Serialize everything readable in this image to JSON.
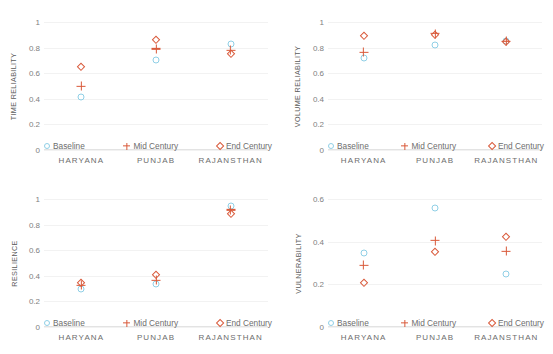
{
  "figure": {
    "categories": [
      "HARYANA",
      "PUNJAB",
      "RAJANSTHAN"
    ],
    "legend": [
      {
        "label": "Baseline",
        "marker": "circle-marker-icon",
        "color": "#8fcfe6"
      },
      {
        "label": "Mid Century",
        "marker": "plus-marker-icon",
        "color": "#d9593a"
      },
      {
        "label": "End Century",
        "marker": "diamond-marker-icon",
        "color": "#d9593a"
      }
    ]
  },
  "chart_data": [
    {
      "type": "scatter",
      "title": "",
      "ylabel": "TIME RELIABILITY",
      "xlabel": "",
      "categories": [
        "HARYANA",
        "PUNJAB",
        "RAJANSTHAN"
      ],
      "ylim": [
        0,
        1
      ],
      "yticks": [
        "0",
        "0.2",
        "0.4",
        "0.6",
        "0.8",
        "1"
      ],
      "ytick_values": [
        0,
        0.2,
        0.4,
        0.6,
        0.8,
        1
      ],
      "grid": true,
      "legend_position": "lower-center",
      "series": [
        {
          "name": "Baseline",
          "values": [
            0.415,
            0.7,
            0.83
          ]
        },
        {
          "name": "Mid Century",
          "values": [
            0.5,
            0.79,
            0.78
          ]
        },
        {
          "name": "End Century",
          "values": [
            0.65,
            0.86,
            0.75
          ]
        }
      ]
    },
    {
      "type": "scatter",
      "title": "",
      "ylabel": "VOLUME RELIABILITY",
      "xlabel": "",
      "categories": [
        "HARYANA",
        "PUNJAB",
        "RAJANSTHAN"
      ],
      "ylim": [
        0,
        1
      ],
      "yticks": [
        "0",
        "0.2",
        "0.4",
        "0.6",
        "0.8",
        "1"
      ],
      "ytick_values": [
        0,
        0.2,
        0.4,
        0.6,
        0.8,
        1
      ],
      "grid": true,
      "legend_position": "lower-center",
      "series": [
        {
          "name": "Baseline",
          "values": [
            0.72,
            0.82,
            0.85
          ]
        },
        {
          "name": "Mid Century",
          "values": [
            0.765,
            0.91,
            0.85
          ]
        },
        {
          "name": "End Century",
          "values": [
            0.89,
            0.9,
            0.845
          ]
        }
      ]
    },
    {
      "type": "scatter",
      "title": "",
      "ylabel": "RESILIENCE",
      "xlabel": "",
      "categories": [
        "HARYANA",
        "PUNJAB",
        "RAJANSTHAN"
      ],
      "ylim": [
        0,
        1
      ],
      "yticks": [
        "0",
        "0.2",
        "0.4",
        "0.6",
        "0.8",
        "1"
      ],
      "ytick_values": [
        0,
        0.2,
        0.4,
        0.6,
        0.8,
        1
      ],
      "grid": true,
      "legend_position": "lower-center",
      "series": [
        {
          "name": "Baseline",
          "values": [
            0.295,
            0.335,
            0.945
          ]
        },
        {
          "name": "Mid Century",
          "values": [
            0.325,
            0.365,
            0.915
          ]
        },
        {
          "name": "End Century",
          "values": [
            0.345,
            0.405,
            0.885
          ]
        }
      ]
    },
    {
      "type": "scatter",
      "title": "",
      "ylabel": "VULNERABILITY",
      "xlabel": "",
      "categories": [
        "HARYANA",
        "PUNJAB",
        "RAJANSTHAN"
      ],
      "ylim": [
        0,
        0.6
      ],
      "yticks": [
        "0",
        "0.2",
        "0.4",
        "0.6"
      ],
      "ytick_values": [
        0,
        0.2,
        0.4,
        0.6
      ],
      "grid": true,
      "legend_position": "lower-center",
      "series": [
        {
          "name": "Baseline",
          "values": [
            0.345,
            0.56,
            0.25
          ]
        },
        {
          "name": "Mid Century",
          "values": [
            0.29,
            0.405,
            0.355
          ]
        },
        {
          "name": "End Century",
          "values": [
            0.205,
            0.35,
            0.42
          ]
        }
      ]
    }
  ]
}
